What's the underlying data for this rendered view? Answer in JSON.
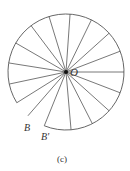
{
  "figure": {
    "caption": "(c)",
    "center_label": "O",
    "point_b_label": "B",
    "point_b_prime_label": "B'",
    "stroke_color": "#555555",
    "center": {
      "x": 66,
      "y": 72
    },
    "radius": 58,
    "arc_start_deg": 248,
    "arc_end_deg": 212,
    "radial_angles_deg": [
      248,
      229,
      212,
      192,
      171,
      150,
      127,
      107,
      86,
      64,
      42,
      21,
      0,
      -21,
      -42,
      -63,
      -85
    ]
  }
}
